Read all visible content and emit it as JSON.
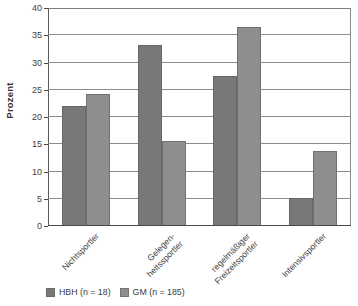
{
  "chart_data": {
    "type": "bar",
    "title": "",
    "subtitle": "",
    "xlabel": "",
    "ylabel": "Prozent",
    "ylim": [
      0,
      40
    ],
    "yticks": [
      0,
      5,
      10,
      15,
      20,
      25,
      30,
      35,
      40
    ],
    "ytick_labels": [
      "0",
      "5",
      "10",
      "15",
      "20",
      "25",
      "30",
      "35",
      "40"
    ],
    "grid": true,
    "legend_position": "bottom-left",
    "categories": [
      "Nichtsportler",
      "Gelegen-\nheitssportler",
      "regelmäßiger\nFreizeitsportler",
      "Intensivsportler"
    ],
    "series": [
      {
        "name": "HBH (n = 18)",
        "color": "#787878",
        "values": [
          22.1,
          33.2,
          27.5,
          5.2
        ]
      },
      {
        "name": "GM (n = 185)",
        "color": "#8e8e8e",
        "values": [
          24.2,
          15.6,
          36.6,
          13.7
        ]
      }
    ]
  }
}
